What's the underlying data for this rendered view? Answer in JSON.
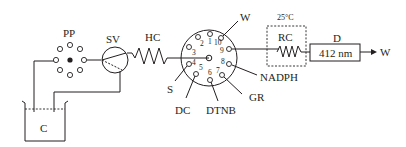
{
  "diagram": {
    "components": {
      "container": {
        "label": "C"
      },
      "peristaltic_pump": {
        "label": "PP"
      },
      "selection_valve": {
        "label": "SV"
      },
      "holding_coil": {
        "label": "HC"
      },
      "reaction_coil": {
        "label": "RC",
        "temperature": "25°C"
      },
      "detector": {
        "label": "D",
        "wavelength": "412 nm"
      },
      "waste_out": {
        "label": "W"
      }
    },
    "multiport_valve": {
      "ports": [
        {
          "num": "1",
          "label": ""
        },
        {
          "num": "2",
          "label": ""
        },
        {
          "num": "3",
          "label": ""
        },
        {
          "num": "4",
          "label": "S"
        },
        {
          "num": "5",
          "label": "DC"
        },
        {
          "num": "6",
          "label": "DTNB"
        },
        {
          "num": "7",
          "label": "GR"
        },
        {
          "num": "8",
          "label": "NADPH"
        },
        {
          "num": "9",
          "label": ""
        },
        {
          "num": "10",
          "label": "W"
        }
      ]
    },
    "colors": {
      "line": "#231f20",
      "background": "#ffffff"
    }
  }
}
